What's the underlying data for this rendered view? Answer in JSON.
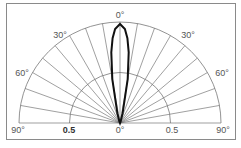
{
  "chart_data": {
    "type": "polar",
    "title": "",
    "subtitle": "",
    "angular_range_deg": [
      -90,
      90
    ],
    "angular_tick_labels": [
      "90°",
      "60°",
      "30°",
      "0°",
      "30°",
      "60°",
      "90°"
    ],
    "angular_grid_step_deg": 10,
    "radial_range": [
      0,
      1
    ],
    "radial_tick_labels": [
      "0.5",
      "0°",
      "0.5"
    ],
    "radial_grid": [
      0.5,
      1.0
    ],
    "grid": true,
    "legend": null,
    "series": [
      {
        "name": "radiation pattern",
        "angles_deg": [
          -90,
          -20,
          -15,
          -10,
          -7,
          -5,
          -3,
          0,
          3,
          5,
          7,
          10,
          15,
          20,
          90
        ],
        "values": [
          0,
          0.02,
          0.1,
          0.45,
          0.72,
          0.86,
          0.95,
          1.0,
          0.95,
          0.86,
          0.72,
          0.45,
          0.1,
          0.02,
          0
        ]
      }
    ]
  },
  "labels": {
    "top": "0°",
    "left30": "30°",
    "right30": "30°",
    "left60": "60°",
    "right60": "60°",
    "left90": "90°",
    "right90": "90°",
    "left05": "0.5",
    "center0": "0°",
    "right05": "0.5"
  }
}
